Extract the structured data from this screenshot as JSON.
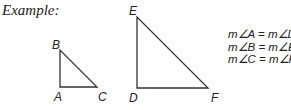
{
  "title": "Example:",
  "small_triangle": {
    "vertices": {
      "A": [
        60,
        87
      ],
      "B": [
        60,
        50
      ],
      "C": [
        97,
        87
      ]
    },
    "labels": {
      "A": "A",
      "B": "B",
      "C": "C"
    }
  },
  "large_triangle": {
    "vertices": {
      "D": [
        137,
        88
      ],
      "E": [
        137,
        17
      ],
      "F": [
        208,
        88
      ]
    },
    "labels": {
      "D": "D",
      "E": "E",
      "F": "F"
    }
  },
  "equations": [
    "m∠A = m∠D",
    "m∠B = m∠E",
    "m∠C = m∠F"
  ],
  "colors": {
    "stroke": "#333333",
    "text": "#222222"
  }
}
